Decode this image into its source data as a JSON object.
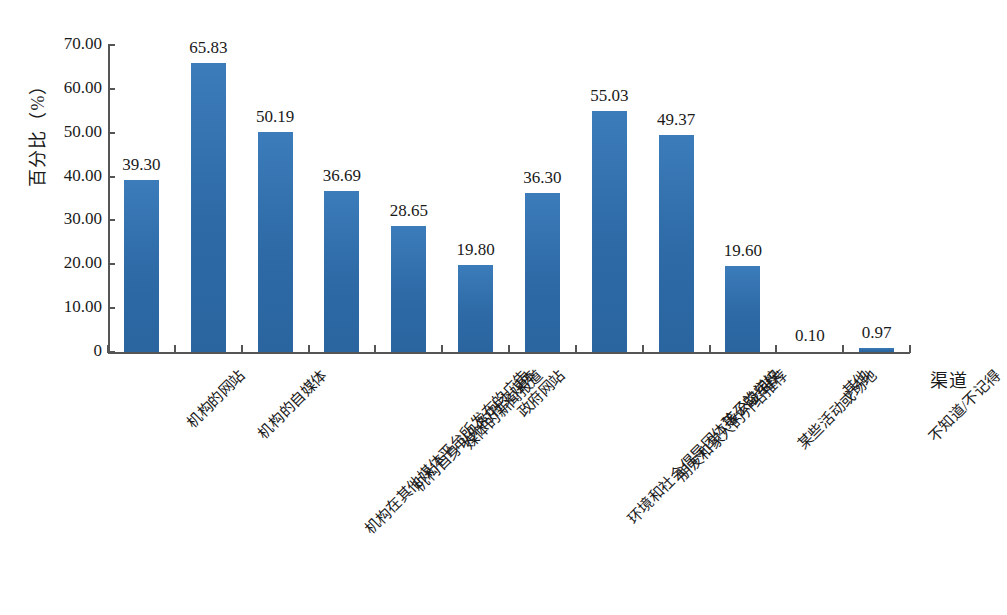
{
  "chart_data": {
    "type": "bar",
    "title": "",
    "subtitle": "",
    "xlabel": "渠道",
    "ylabel": "百分比（%）",
    "ylim": [
      0,
      70
    ],
    "ytick_labels": [
      "0",
      "10.00",
      "20.00",
      "30.00",
      "40.00",
      "50.00",
      "60.00",
      "70.00"
    ],
    "ytick_values": [
      0,
      10,
      20,
      30,
      40,
      50,
      60,
      70
    ],
    "grid": false,
    "legend": "none",
    "bar_color": "#2f6fae",
    "axis_color": "#555555",
    "value_label_format": "0.00",
    "categories": [
      "机构的网站",
      "机构的自媒体",
      "机构在其他媒体平台所发布的广告",
      "机构自身以外的社交媒体",
      "媒体的新闻报道",
      "政府网站",
      "环境和社会倡导团体等公益组织",
      "朋友和家人的介绍推荐",
      "孩子的学校",
      "某些活动或场地",
      "其他",
      "不知道/不记得"
    ],
    "values": [
      39.3,
      65.83,
      50.19,
      36.69,
      28.65,
      19.8,
      36.3,
      55.03,
      49.37,
      19.6,
      0.1,
      0.97
    ],
    "value_labels": [
      "39.30",
      "65.83",
      "50.19",
      "36.69",
      "28.65",
      "19.80",
      "36.30",
      "55.03",
      "49.37",
      "19.60",
      "0.10",
      "0.97"
    ]
  }
}
